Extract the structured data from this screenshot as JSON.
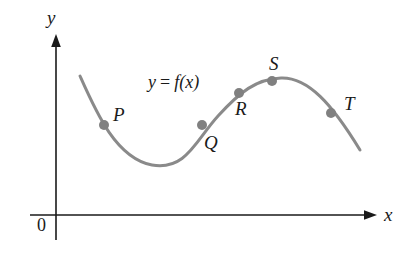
{
  "figure": {
    "background_color": "#ffffff",
    "curve_color": "#8a8a8a",
    "point_color": "#808080",
    "axis_color": "#1a1a1a",
    "text_color": "#1a1a1a"
  },
  "axes": {
    "x_label": "x",
    "y_label": "y",
    "origin_label": "0"
  },
  "function_label": {
    "lhs": "y",
    "operator": "=",
    "rhs": "f(x)",
    "full": "y = f(x)"
  },
  "points": [
    {
      "name": "P",
      "label": "P",
      "cx": 104,
      "cy": 125,
      "label_x": 113,
      "label_y": 105
    },
    {
      "name": "Q",
      "label": "Q",
      "cx": 202,
      "cy": 125,
      "label_x": 204,
      "label_y": 133
    },
    {
      "name": "R",
      "label": "R",
      "cx": 239,
      "cy": 93,
      "label_x": 235,
      "label_y": 99
    },
    {
      "name": "S",
      "label": "S",
      "cx": 272,
      "cy": 81,
      "label_x": 269,
      "label_y": 54
    },
    {
      "name": "T",
      "label": "T",
      "cx": 331,
      "cy": 113,
      "label_x": 344,
      "label_y": 94
    }
  ],
  "chart_data": {
    "type": "line",
    "xlabel": "x",
    "ylabel": "y",
    "grid": false,
    "legend": "none",
    "annotations": [
      "P",
      "Q",
      "R",
      "S",
      "T",
      "y = f(x)",
      "0"
    ],
    "curve_path": "M 80 76 C 96 112, 116 158, 152 165 C 186 171, 196 140, 218 116 C 240 92, 256 79, 281 78 C 308 77, 332 104, 360 150",
    "features": [
      {
        "kind": "curve-start",
        "x": 80,
        "y": 76
      },
      {
        "kind": "local-minimum",
        "x": 152,
        "y": 165
      },
      {
        "kind": "inflection",
        "x": 202,
        "y": 125
      },
      {
        "kind": "local-maximum",
        "x": 281,
        "y": 78
      },
      {
        "kind": "curve-end",
        "x": 360,
        "y": 150
      }
    ],
    "axis_geometry": {
      "x_axis_y": 215,
      "x_axis_start": 30,
      "x_axis_end": 375,
      "y_axis_x": 56,
      "y_axis_top": 35,
      "y_axis_bottom": 240
    }
  }
}
